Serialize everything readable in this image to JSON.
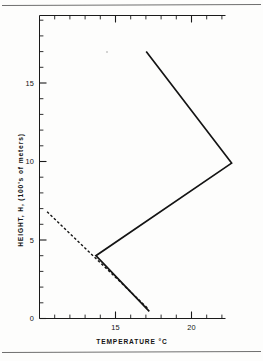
{
  "figure": {
    "title": "",
    "background_color": "#fdfdfc",
    "ink_color": "#141414",
    "page_rules": [
      {
        "name": "top-rule",
        "y": 5
      },
      {
        "name": "bottom-rule",
        "y": 352
      }
    ]
  },
  "chart_data": {
    "type": "line",
    "title": "",
    "subtitle": "",
    "xlabel": "TEMPERATURE  °C",
    "ylabel": "HEIGHT, H, (100's of meters)",
    "xlim": [
      10.0,
      22.2
    ],
    "ylim": [
      0,
      19.3
    ],
    "grid": false,
    "legend": null,
    "legend_position": "none",
    "x_major_ticks": [
      15,
      20
    ],
    "x_major_tick_labels": [
      "15",
      "20"
    ],
    "x_minor_tick_step": 1,
    "y_major_ticks": [
      0,
      5,
      10,
      15
    ],
    "y_major_tick_labels": [
      "0",
      "5",
      "10",
      "15"
    ],
    "y_minor_tick_step": 1,
    "axis_direction": "x = temperature (deg C), y = height (100's of meters)",
    "series": [
      {
        "name": "measured temperature profile",
        "style": "solid",
        "x": [
          17.2,
          13.7,
          22.6,
          17.0
        ],
        "y": [
          0.45,
          4.0,
          9.9,
          17.0
        ]
      },
      {
        "name": "dry adiabatic reference lapse line",
        "style": "dashed",
        "x": [
          10.5,
          17.1
        ],
        "y": [
          6.8,
          0.65
        ]
      }
    ],
    "annotations": []
  },
  "axes_labels": {
    "x_axis_title": "TEMPERATURE  °C",
    "y_axis_title": "HEIGHT, H, (100's of meters)",
    "y_tick_0": "0",
    "y_tick_5": "5",
    "y_tick_10": "10",
    "y_tick_15": "15",
    "x_tick_15": "15",
    "x_tick_20": "20"
  }
}
